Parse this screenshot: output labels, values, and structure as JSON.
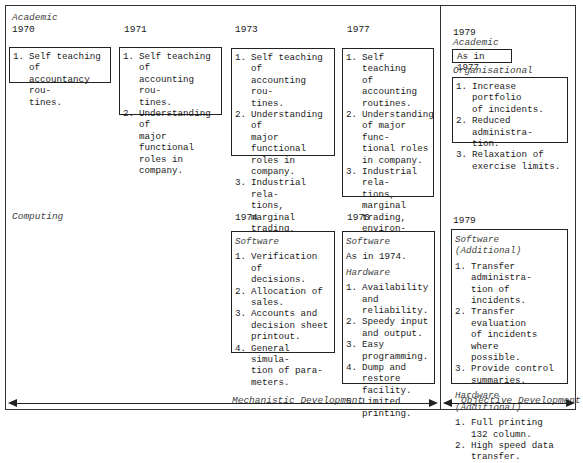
{
  "rows": {
    "academic": {
      "label": "Academic",
      "columns": [
        {
          "year": "1970",
          "items": [
            "Self teaching of\naccountancy rou-\ntines."
          ]
        },
        {
          "year": "1971",
          "items": [
            "Self teaching of\naccounting rou-\ntines.",
            "Understanding of\nmajor functional\nroles in company."
          ]
        },
        {
          "year": "1973",
          "items": [
            "Self teaching of\naccounting rou-\ntines.",
            "Understanding of\nmajor functional\nroles in company.",
            "Industrial rela-\ntions, marginal\ntrading, environ-\nmental control."
          ]
        },
        {
          "year": "1977",
          "items": [
            "Self teaching\nof accounting\nroutines.",
            "Understanding\nof major func-\ntional roles\nin company.",
            "Industrial rela-\ntions, marginal\ntrading, environ-\nmental control.",
            "Appreciation of\nplanning and\nforecasting."
          ]
        }
      ],
      "objective": {
        "year": "1979",
        "academic_label": "Academic",
        "academic_value": "As in 1977",
        "organisational_label": "Organisational",
        "items": [
          "Increase portfolio\nof incidents.",
          "Reduced administra-\ntion.",
          "Relaxation of\nexercise limits."
        ]
      }
    },
    "computing": {
      "label": "Computing",
      "columns": [
        {
          "year": "1974",
          "software_label": "Software",
          "software_items": [
            "Verification of\ndecisions.",
            "Allocation of\nsales.",
            "Accounts and\ndecision sheet\nprintout.",
            "General simula-\ntion of para-\nmeters."
          ]
        },
        {
          "year": "1976",
          "software_label": "Software",
          "software_value": "As in 1974.",
          "hardware_label": "Hardware",
          "hardware_items": [
            "Availability\nand reliability.",
            "Speedy input\nand output.",
            "Easy programming.",
            "Dump and restore\nfacility.",
            "Limited printing."
          ]
        }
      ],
      "objective": {
        "year": "1979",
        "software_label": "Software (Additional)",
        "software_items": [
          "Transfer administra-\ntion of incidents.",
          "Transfer evaluation\nof incidents where\npossible.",
          "Provide control\nsummaries."
        ],
        "hardware_label": "Hardware (Additional)",
        "hardware_items": [
          "Full printing\n132 column.",
          "High speed data\ntransfer."
        ]
      }
    }
  },
  "phases": {
    "mechanistic": "Mechanistic Development",
    "objective": "Objective Development"
  }
}
